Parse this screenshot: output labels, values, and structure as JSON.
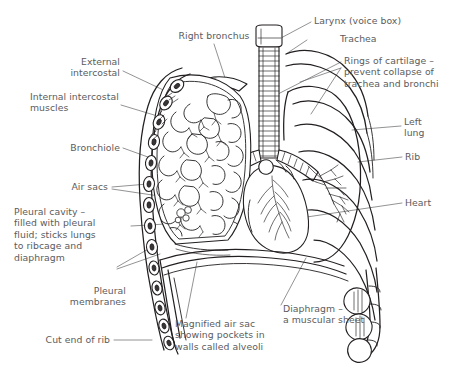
{
  "figure": {
    "background_color": "#ffffff",
    "ink_color": "#231f20",
    "text_color": "#5b5c5e"
  },
  "labels": {
    "right_bronchus": "Right bronchus",
    "larynx": "Larynx (voice box)",
    "trachea": "Trachea",
    "rings_of_cartilage": "Rings of cartilage –\nprevent collapse of\ntrachea and bronchi",
    "external_intercostal": "External\nintercostal",
    "internal_intercostal_muscles": "Internal intercostal\nmuscles",
    "bronchiole": "Bronchiole",
    "air_sacs": "Air sacs",
    "pleural_cavity": "Pleural cavity –\nfilled with pleural\nfluid; sticks lungs\nto ribcage and\ndiaphragm",
    "pleural_membranes": "Pleural\nmembranes",
    "cut_end_of_rib": "Cut end of rib",
    "left_lung": "Left\nlung",
    "rib": "Rib",
    "heart": "Heart",
    "diaphragm": "Diaphragm –\na muscular sheet",
    "magnified_air_sac": "Magnified air sac\nshowing pockets in\nwalls called alveoli"
  }
}
